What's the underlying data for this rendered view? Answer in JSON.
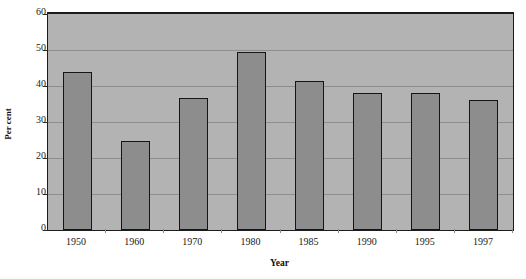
{
  "chart_data": {
    "type": "bar",
    "title": "",
    "subtitle": "",
    "xlabel": "Year",
    "ylabel": "Per cent",
    "categories": [
      "1950",
      "1960",
      "1970",
      "1980",
      "1985",
      "1990",
      "1995",
      "1997"
    ],
    "values": [
      44,
      24.8,
      36.8,
      49.5,
      41.5,
      38,
      38,
      36
    ],
    "series": [
      {
        "name": "Per cent",
        "values": [
          44,
          24.8,
          36.8,
          49.5,
          41.5,
          38,
          38,
          36
        ]
      }
    ],
    "ylim": [
      0,
      60
    ],
    "ytick_labels": [
      "0",
      "10",
      "20",
      "30",
      "40",
      "50",
      "60"
    ],
    "ytick_values": [
      0,
      10,
      20,
      30,
      40,
      50,
      60
    ],
    "grid": true,
    "grid_axis": "y",
    "legend": false,
    "legend_position": "none",
    "annotations": [],
    "colors": {
      "bar_fill": "#8d8d8d",
      "bar_border": "#151515",
      "plot_background": "#b3b3b3",
      "gridline": "#8e8e8e",
      "axis": "#1c1c1c",
      "text": "#1a1a1a",
      "page_background": "#ffffff"
    }
  }
}
